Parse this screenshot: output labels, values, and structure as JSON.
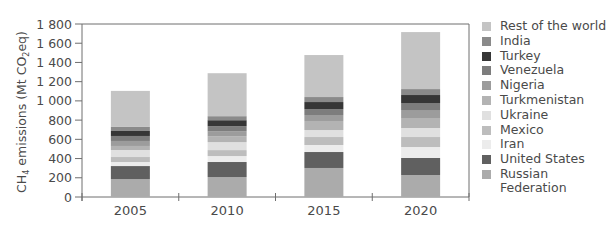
{
  "chart_data": {
    "type": "bar",
    "stacked": true,
    "title": "",
    "xlabel": "",
    "ylabel": "CH4 emissions (Mt CO2eq)",
    "ylabel_parts": {
      "pre": "CH",
      "sub1": "4",
      "mid": " emissions (Mt CO",
      "sub2": "2",
      "post": "eq)"
    },
    "ylim": [
      0,
      1800
    ],
    "yticks": [
      0,
      200,
      400,
      600,
      800,
      1000,
      1200,
      1400,
      1600,
      1800
    ],
    "ytick_labels": [
      "0",
      "200",
      "400",
      "600",
      "800",
      "1 000",
      "1 200",
      "1 400",
      "1 600",
      "1 800"
    ],
    "categories": [
      "2005",
      "2010",
      "2015",
      "2020"
    ],
    "grid": false,
    "legend_position": "right",
    "series": [
      {
        "name": "Russian Federation",
        "color": "#ababab",
        "values": [
          187,
          208,
          302,
          229
        ]
      },
      {
        "name": "United States",
        "color": "#606060",
        "values": [
          135,
          156,
          166,
          177
        ]
      },
      {
        "name": "Iran",
        "color": "#ececec",
        "values": [
          42,
          62,
          73,
          114
        ]
      },
      {
        "name": "Mexico",
        "color": "#bdbdbd",
        "values": [
          52,
          62,
          83,
          104
        ]
      },
      {
        "name": "Ukraine",
        "color": "#e0e0e0",
        "values": [
          73,
          83,
          73,
          94
        ]
      },
      {
        "name": "Turkmenistan",
        "color": "#b3b3b3",
        "values": [
          42,
          62,
          94,
          104
        ]
      },
      {
        "name": "Nigeria",
        "color": "#9c9c9c",
        "values": [
          52,
          52,
          62,
          83
        ]
      },
      {
        "name": "Venezuela",
        "color": "#7d7d7d",
        "values": [
          52,
          52,
          62,
          73
        ]
      },
      {
        "name": "Turkey",
        "color": "#363636",
        "values": [
          52,
          62,
          73,
          83
        ]
      },
      {
        "name": "India",
        "color": "#8a8a8a",
        "values": [
          42,
          42,
          52,
          62
        ]
      },
      {
        "name": "Rest of the world",
        "color": "#c4c4c4",
        "values": [
          375,
          447,
          437,
          593
        ]
      }
    ],
    "totals": [
      1104,
      1290,
      1477,
      1716
    ]
  },
  "legend": {
    "items": [
      {
        "label": "Rest of the world",
        "color": "#c4c4c4"
      },
      {
        "label": "India",
        "color": "#8a8a8a"
      },
      {
        "label": "Turkey",
        "color": "#363636"
      },
      {
        "label": "Venezuela",
        "color": "#7d7d7d"
      },
      {
        "label": "Nigeria",
        "color": "#9c9c9c"
      },
      {
        "label": "Turkmenistan",
        "color": "#b3b3b3"
      },
      {
        "label": "Ukraine",
        "color": "#e0e0e0"
      },
      {
        "label": "Mexico",
        "color": "#bdbdbd"
      },
      {
        "label": "Iran",
        "color": "#ececec"
      },
      {
        "label": "United States",
        "color": "#606060"
      },
      {
        "label": "Russian\nFederation",
        "color": "#ababab"
      }
    ]
  }
}
